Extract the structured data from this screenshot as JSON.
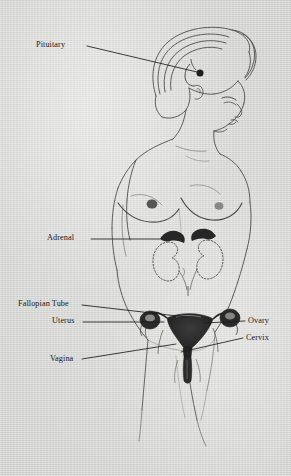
{
  "diagram": {
    "medium": "printed book illustration on greyish paper",
    "paper_color": "#d9d9d7",
    "ink_color": "#2b2b2b",
    "label_color": "#1a1a1a",
    "organ_fill_color": "#2f2f2f"
  },
  "labels": [
    {
      "id": "pituitary",
      "text": "Pituitary",
      "side": "left",
      "x": 36,
      "y": 41,
      "leader": {
        "x1": 87,
        "y1": 46,
        "x2": 197,
        "y2": 72
      }
    },
    {
      "id": "adrenal",
      "text": "Adrenal",
      "side": "left",
      "x": 47,
      "y": 234,
      "leader": {
        "x1": 91,
        "y1": 239,
        "x2": 160,
        "y2": 239
      }
    },
    {
      "id": "fallopian-tube",
      "text": "Fallopian Tube",
      "side": "left",
      "x": 18,
      "y": 300,
      "leader": {
        "x1": 82,
        "y1": 305,
        "x2": 186,
        "y2": 317
      }
    },
    {
      "id": "uterus",
      "text": "Uterus",
      "side": "left",
      "x": 52,
      "y": 317,
      "leader": {
        "x1": 83,
        "y1": 322,
        "x2": 164,
        "y2": 322
      }
    },
    {
      "id": "vagina",
      "text": "Vagina",
      "side": "left",
      "x": 50,
      "y": 355,
      "leader": {
        "x1": 82,
        "y1": 359,
        "x2": 176,
        "y2": 344
      }
    },
    {
      "id": "ovary",
      "text": "Ovary",
      "side": "right",
      "x": 248,
      "y": 317,
      "leader": {
        "x1": 245,
        "y1": 321,
        "x2": 204,
        "y2": 323
      }
    },
    {
      "id": "cervix",
      "text": "Cervix",
      "side": "right",
      "x": 246,
      "y": 334,
      "leader": {
        "x1": 243,
        "y1": 338,
        "x2": 181,
        "y2": 352
      }
    }
  ],
  "anatomy_parts": [
    {
      "id": "pituitary-gland",
      "description": "small dark filled circle at base of brain"
    },
    {
      "id": "adrenal-glands",
      "description": "two dark caps sitting on top of the kidneys"
    },
    {
      "id": "kidneys",
      "description": "pair of dotted-outline bean shapes flanking the spine"
    },
    {
      "id": "uterus",
      "description": "dark inverted triangular body in the pelvis"
    },
    {
      "id": "ovaries",
      "description": "two dark rounded masses lateral to the uterus"
    },
    {
      "id": "fallopian-tubes",
      "description": "curved tubes joining ovaries to uterus"
    },
    {
      "id": "cervix",
      "description": "narrow neck below the uterine body"
    },
    {
      "id": "vagina",
      "description": "canal descending from the cervix"
    }
  ]
}
